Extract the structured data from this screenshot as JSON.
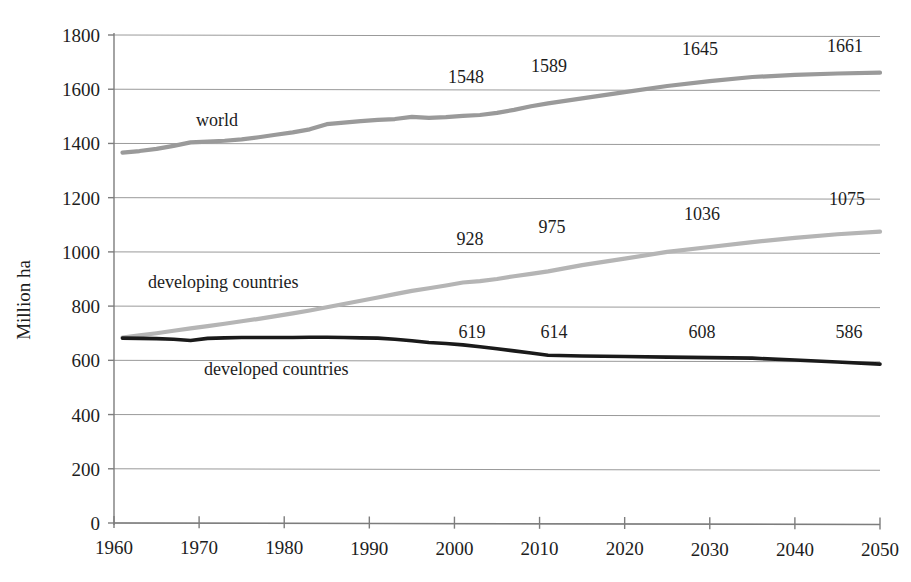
{
  "chart_data": {
    "type": "line",
    "title": "",
    "xlabel": "",
    "ylabel": "Million ha",
    "xlim": [
      1960,
      2050
    ],
    "ylim": [
      0,
      1800
    ],
    "y_ticks": [
      0,
      200,
      400,
      600,
      800,
      1000,
      1200,
      1400,
      1600,
      1800
    ],
    "x_ticks": [
      1960,
      1970,
      1980,
      1990,
      2000,
      2010,
      2020,
      2030,
      2040,
      2050
    ],
    "y_tick_labels": [
      "0",
      "200",
      "400",
      "600",
      "800",
      "1000",
      "1200",
      "1400",
      "1600",
      "1800"
    ],
    "x_tick_labels": [
      "1960",
      "1970",
      "1980",
      "1990",
      "2000",
      "2010",
      "2020",
      "2030",
      "2040",
      "2050"
    ],
    "grid": true,
    "legend_position": "inline-annotations",
    "x": [
      1961,
      1963,
      1965,
      1967,
      1969,
      1971,
      1973,
      1975,
      1977,
      1979,
      1981,
      1983,
      1985,
      1987,
      1989,
      1991,
      1993,
      1995,
      1997,
      1999,
      2001,
      2003,
      2005,
      2007,
      2009,
      2011,
      2015,
      2020,
      2025,
      2030,
      2035,
      2040,
      2045,
      2050
    ],
    "series": [
      {
        "name": "world",
        "color": "#9a9a9a",
        "values": [
          1366,
          1372,
          1380,
          1391,
          1404,
          1407,
          1410,
          1415,
          1423,
          1432,
          1441,
          1452,
          1471,
          1477,
          1482,
          1487,
          1490,
          1498,
          1494,
          1497,
          1502,
          1505,
          1513,
          1524,
          1537,
          1548,
          1566,
          1589,
          1612,
          1630,
          1645,
          1653,
          1658,
          1661
        ]
      },
      {
        "name": "developing countries",
        "color": "#b5b5b5",
        "values": [
          684,
          692,
          700,
          709,
          718,
          726,
          735,
          744,
          753,
          763,
          773,
          784,
          796,
          808,
          820,
          832,
          844,
          856,
          866,
          876,
          887,
          892,
          900,
          910,
          919,
          928,
          951,
          975,
          1000,
          1018,
          1036,
          1052,
          1065,
          1075
        ]
      },
      {
        "name": "developed countries",
        "color": "#1a1a1a",
        "values": [
          682,
          681,
          680,
          678,
          673,
          681,
          683,
          684,
          684,
          684,
          684,
          685,
          685,
          684,
          683,
          682,
          678,
          672,
          666,
          662,
          657,
          650,
          643,
          635,
          627,
          619,
          616,
          614,
          612,
          610,
          608,
          601,
          594,
          586
        ]
      }
    ],
    "annotations": [
      {
        "series": "world",
        "x": 2011,
        "label": "1548",
        "lx": 466,
        "ly": 83
      },
      {
        "series": "world",
        "x": 2020,
        "label": "1589",
        "lx": 549,
        "ly": 72
      },
      {
        "series": "world",
        "x": 2035,
        "label": "1645",
        "lx": 700,
        "ly": 55
      },
      {
        "series": "world",
        "x": 2050,
        "label": "1661",
        "lx": 845,
        "ly": 52
      },
      {
        "series": "developing countries",
        "x": 2011,
        "label": "928",
        "lx": 470,
        "ly": 245
      },
      {
        "series": "developing countries",
        "x": 2020,
        "label": "975",
        "lx": 552,
        "ly": 233
      },
      {
        "series": "developing countries",
        "x": 2035,
        "label": "1036",
        "lx": 702,
        "ly": 220
      },
      {
        "series": "developing countries",
        "x": 2050,
        "label": "1075",
        "lx": 847,
        "ly": 205
      },
      {
        "series": "developed countries",
        "x": 2011,
        "label": "619",
        "lx": 472,
        "ly": 338
      },
      {
        "series": "developed countries",
        "x": 2020,
        "label": "614",
        "lx": 554,
        "ly": 338
      },
      {
        "series": "developed countries",
        "x": 2035,
        "label": "608",
        "lx": 702,
        "ly": 338
      },
      {
        "series": "developed countries",
        "x": 2050,
        "label": "586",
        "lx": 849,
        "ly": 338
      }
    ],
    "series_labels": [
      {
        "text": "world",
        "lx": 196,
        "ly": 126
      },
      {
        "text": "developing countries",
        "lx": 148,
        "ly": 288
      },
      {
        "text": "developed countries",
        "lx": 204,
        "ly": 375
      }
    ]
  },
  "colors": {
    "world": "#9a9a9a",
    "developing": "#b5b5b5",
    "developed": "#1a1a1a",
    "grid": "#9a9a9a",
    "axis": "#7d7d7d",
    "text": "#1a1a1a",
    "background": "#ffffff"
  }
}
